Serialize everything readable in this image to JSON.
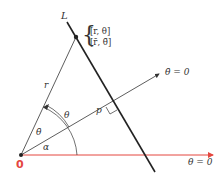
{
  "diagram": {
    "labels": {
      "line": "L",
      "point_coords_1": "[r, θ]",
      "point_coords_2": "[r̄, θ̄]",
      "rotated_axis": "θ̄ = 0",
      "polar_axis": "θ = 0",
      "radius": "r",
      "distance": "p",
      "angle_theta": "θ",
      "angle_theta_bar": "θ̄",
      "angle_alpha": "α",
      "origin": "0"
    },
    "colors": {
      "ink": "#333333",
      "polar_axis": "#e4473f",
      "origin_label": "#e4473f"
    },
    "geometry": {
      "origin": [
        21,
        155
      ],
      "point": [
        76,
        37
      ],
      "line_start": [
        67,
        22
      ],
      "line_end": [
        155,
        172
      ],
      "rotated_axis_end": [
        160,
        74
      ],
      "polar_axis_end": [
        213,
        155
      ],
      "foot_of_perpendicular": [
        113,
        103
      ]
    }
  }
}
